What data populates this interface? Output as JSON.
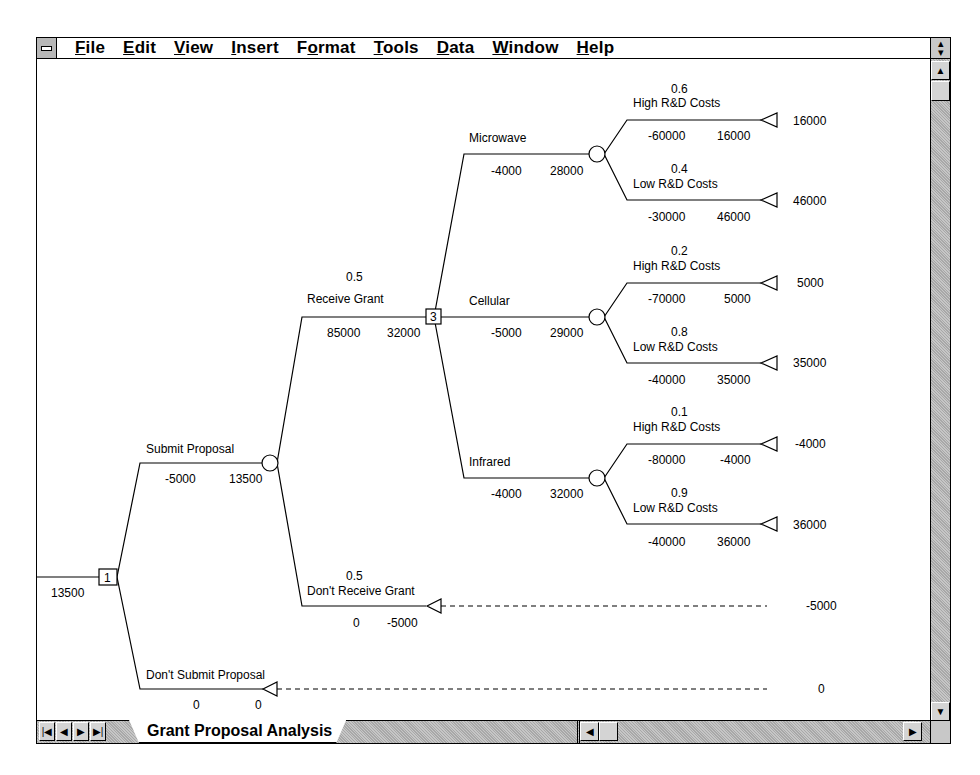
{
  "menubar": {
    "system_menu_icon": "system-menu-dash-icon",
    "items": [
      {
        "label": "File",
        "mnemonic": "F"
      },
      {
        "label": "Edit",
        "mnemonic": "E"
      },
      {
        "label": "View",
        "mnemonic": "V"
      },
      {
        "label": "Insert",
        "mnemonic": "I"
      },
      {
        "label": "Format",
        "mnemonic": "o"
      },
      {
        "label": "Tools",
        "mnemonic": "T"
      },
      {
        "label": "Data",
        "mnemonic": "D"
      },
      {
        "label": "Window",
        "mnemonic": "W"
      },
      {
        "label": "Help",
        "mnemonic": "H"
      }
    ],
    "restore_icon": "restore-updown-icon"
  },
  "sheet": {
    "active_tab": "Grant Proposal Analysis",
    "nav_icons": [
      "first-sheet-icon",
      "prev-sheet-icon",
      "next-sheet-icon",
      "last-sheet-icon"
    ]
  },
  "tree": {
    "root_value": "13500",
    "decision1_label": "1",
    "decision3_label": "3",
    "branches": {
      "submit": {
        "label": "Submit Proposal",
        "cash": "-5000",
        "value": "13500"
      },
      "dont_submit": {
        "label": "Don't Submit Proposal",
        "cash": "0",
        "value": "0",
        "payoff": "0"
      },
      "receive": {
        "prob": "0.5",
        "label": "Receive Grant",
        "cash": "85000",
        "value": "32000"
      },
      "dont_receive": {
        "prob": "0.5",
        "label": "Don't Receive Grant",
        "cash": "0",
        "value": "-5000",
        "payoff": "-5000"
      },
      "microwave": {
        "label": "Microwave",
        "cash": "-4000",
        "value": "28000",
        "high": {
          "prob": "0.6",
          "label": "High R&D Costs",
          "cash": "-60000",
          "value": "16000",
          "payoff": "16000"
        },
        "low": {
          "prob": "0.4",
          "label": "Low R&D Costs",
          "cash": "-30000",
          "value": "46000",
          "payoff": "46000"
        }
      },
      "cellular": {
        "label": "Cellular",
        "cash": "-5000",
        "value": "29000",
        "high": {
          "prob": "0.2",
          "label": "High R&D Costs",
          "cash": "-70000",
          "value": "5000",
          "payoff": "5000"
        },
        "low": {
          "prob": "0.8",
          "label": "Low R&D Costs",
          "cash": "-40000",
          "value": "35000",
          "payoff": "35000"
        }
      },
      "infrared": {
        "label": "Infrared",
        "cash": "-4000",
        "value": "32000",
        "high": {
          "prob": "0.1",
          "label": "High R&D Costs",
          "cash": "-80000",
          "value": "-4000",
          "payoff": "-4000"
        },
        "low": {
          "prob": "0.9",
          "label": "Low R&D Costs",
          "cash": "-40000",
          "value": "36000",
          "payoff": "36000"
        }
      }
    }
  }
}
